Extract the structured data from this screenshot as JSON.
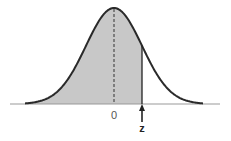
{
  "diagram": {
    "type": "normal-distribution-shaded-left-tail",
    "mean_label": "0",
    "marker_label": "z",
    "shaded_region": "area under curve left of z",
    "z_value_sd": 1.0,
    "colors": {
      "curve": "#2a2a2a",
      "shade": "#c8c8c8",
      "axis": "#888888",
      "arrow": "#222222"
    }
  }
}
